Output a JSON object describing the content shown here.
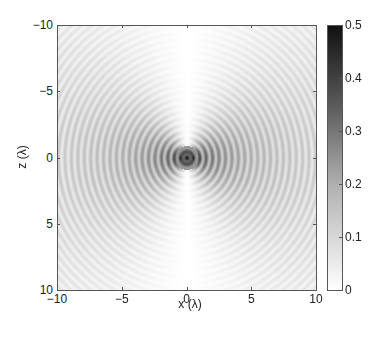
{
  "chart_data": {
    "type": "heatmap",
    "title": "",
    "xlabel": "x (λ)",
    "ylabel": "z (λ)",
    "xlim": [
      -10,
      10
    ],
    "ylim": [
      -10,
      10
    ],
    "y_axis_reversed": true,
    "x_ticks": [
      "-10",
      "-5",
      "0",
      "5",
      "10"
    ],
    "y_ticks": [
      "-10",
      "-5",
      "0",
      "5",
      "10"
    ],
    "colorbar": {
      "range": [
        0,
        0.5
      ],
      "ticks": [
        "0",
        "0.1",
        "0.2",
        "0.3",
        "0.4",
        "0.5"
      ],
      "colormap": "gray_reversed",
      "colors": {
        "low": "#ffffff",
        "high": "#111111"
      }
    },
    "ring_spacing_lambda": 0.5,
    "grid": false
  }
}
